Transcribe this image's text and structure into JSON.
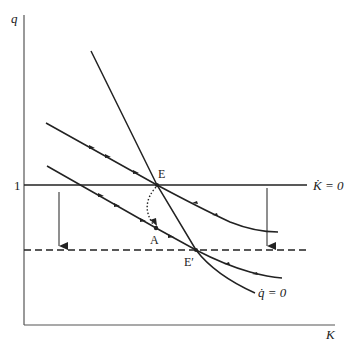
{
  "diagram": {
    "title": "",
    "axes": {
      "y_label": "q",
      "x_label": "K",
      "y_tick": "1"
    },
    "loci": {
      "k_dot_zero": "K̇ = 0",
      "q_dot_zero": "q̇ = 0"
    },
    "points": {
      "E": "E",
      "E_prime": "E′",
      "A": "A"
    },
    "colors": {
      "line": "#222222",
      "background": "#ffffff"
    }
  }
}
